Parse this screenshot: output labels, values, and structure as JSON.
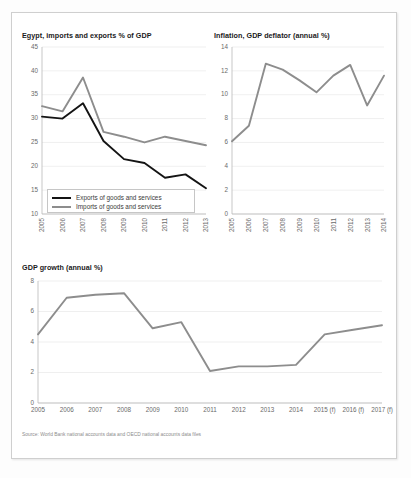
{
  "source_note": "Source: World Bank national accounts data and OECD national accounts data files",
  "charts": [
    {
      "id": "imports-exports",
      "title": "Egypt, imports and exports % of GDP"
    },
    {
      "id": "inflation",
      "title": "Inflation, GDP deflator (annual %)"
    },
    {
      "id": "gdp-growth",
      "title": "GDP growth (annual %)"
    }
  ],
  "legend": {
    "exports_label": "Exports of goods and services",
    "imports_label": "Imports of goods and services"
  },
  "colors": {
    "exports_line": "#141414",
    "imports_line": "#8d8d8d",
    "inflation_line": "#8d8d8d",
    "gdp_growth_line": "#8d8d8d",
    "grid": "#e8e8e8",
    "axis": "#b9b9b9",
    "tick_text": "#6a6a6a",
    "title_text": "#1a1a1a",
    "source_text": "#8c8c8c"
  },
  "chart_data": [
    {
      "type": "line",
      "id": "imports-exports",
      "title": "Egypt, imports and exports % of GDP",
      "xlabel": "",
      "ylabel": "",
      "ylim": [
        10,
        45
      ],
      "yticks": [
        10,
        15,
        20,
        25,
        30,
        35,
        40,
        45
      ],
      "grid": true,
      "legend_position": "bottom-left",
      "categories": [
        "2005",
        "2006",
        "2007",
        "2008",
        "2009",
        "2010",
        "2011",
        "2012",
        "2013"
      ],
      "series": [
        {
          "name": "Exports of goods and services",
          "color": "#141414",
          "values": [
            30.4,
            30.0,
            33.2,
            25.3,
            21.5,
            20.7,
            17.6,
            18.3,
            15.4
          ]
        },
        {
          "name": "Imports of goods and services",
          "color": "#8d8d8d",
          "values": [
            32.6,
            31.5,
            38.6,
            27.2,
            26.2,
            25.0,
            26.2,
            25.3,
            24.4
          ]
        }
      ]
    },
    {
      "type": "line",
      "id": "inflation",
      "title": "Inflation, GDP deflator (annual %)",
      "xlabel": "",
      "ylabel": "",
      "ylim": [
        0,
        14
      ],
      "yticks": [
        0,
        2,
        4,
        6,
        8,
        10,
        12,
        14
      ],
      "grid": true,
      "legend_position": "none",
      "categories": [
        "2005",
        "2006",
        "2007",
        "2008",
        "2009",
        "2010",
        "2011",
        "2012",
        "2013",
        "2014"
      ],
      "series": [
        {
          "name": "Inflation, GDP deflator (annual %)",
          "color": "#8d8d8d",
          "values": [
            6.1,
            7.4,
            12.6,
            12.1,
            11.2,
            10.2,
            11.6,
            12.5,
            9.1,
            11.6
          ]
        }
      ]
    },
    {
      "type": "line",
      "id": "gdp-growth",
      "title": "GDP growth (annual %)",
      "xlabel": "",
      "ylabel": "",
      "ylim": [
        0,
        8
      ],
      "yticks": [
        0,
        2,
        4,
        6,
        8
      ],
      "grid": true,
      "legend_position": "none",
      "categories": [
        "2005",
        "2006",
        "2007",
        "2008",
        "2009",
        "2010",
        "2011",
        "2012",
        "2013",
        "2014",
        "2015 (f)",
        "2016 (f)",
        "2017 (f)"
      ],
      "series": [
        {
          "name": "GDP growth (annual %)",
          "color": "#8d8d8d",
          "values": [
            4.5,
            6.9,
            7.1,
            7.2,
            4.9,
            5.3,
            2.1,
            2.4,
            2.4,
            2.5,
            4.5,
            4.8,
            5.1
          ]
        }
      ]
    }
  ]
}
